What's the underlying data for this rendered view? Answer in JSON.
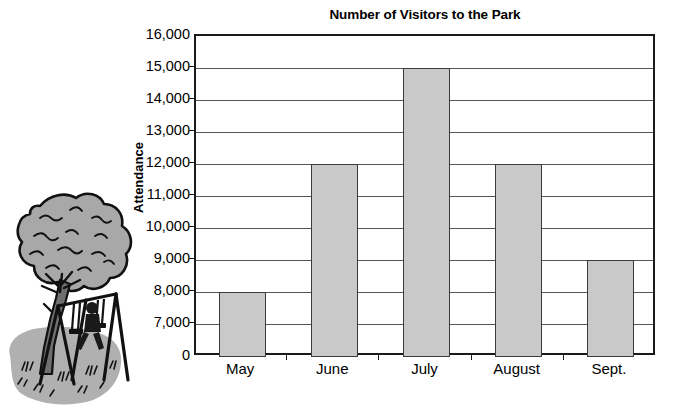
{
  "chart_data": {
    "type": "bar",
    "title": "Number of Visitors to the Park",
    "xlabel": "",
    "ylabel": "Attendance",
    "categories": [
      "May",
      "June",
      "July",
      "August",
      "Sept."
    ],
    "values": [
      8000,
      12000,
      15000,
      12000,
      9000
    ],
    "ytick_labels": [
      "16,000",
      "15,000",
      "14,000",
      "13,000",
      "12,000",
      "11,000",
      "10,000",
      "9,000",
      "8,000",
      "7,000",
      "0"
    ],
    "ytick_values": [
      16000,
      15000,
      14000,
      13000,
      12000,
      11000,
      10000,
      9000,
      8000,
      7000,
      0
    ],
    "ylim": [
      6000,
      16000
    ],
    "axis_break": true,
    "grid": true,
    "legend": false,
    "bar_fill_color": "#c9c9c9",
    "bar_border_color": "#3a3a3a",
    "gridline_color": "#555555",
    "axis_color": "#1a1a1a",
    "background_color": "#ffffff"
  },
  "illustration": {
    "name": "park-tree-and-swing-set",
    "description": "Tree with swing set on a gray ground patch",
    "canopy_color": "#a8a8a8",
    "ground_color": "#b0b0b0",
    "outline_color": "#111111"
  }
}
